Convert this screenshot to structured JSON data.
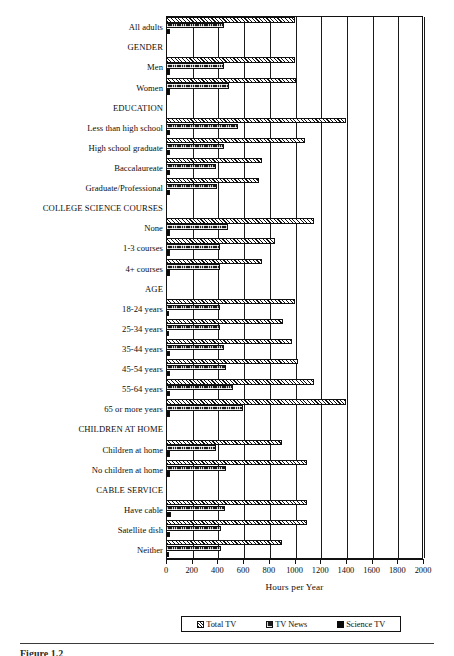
{
  "chart_data": {
    "type": "bar",
    "orientation": "horizontal",
    "title": "",
    "xlabel": "Hours per Year",
    "ylabel": "",
    "xlim": [
      0,
      2000
    ],
    "xticks": [
      0,
      200,
      400,
      600,
      800,
      1000,
      1200,
      1400,
      1600,
      1800,
      2000
    ],
    "grid": true,
    "legend_position": "bottom",
    "series": [
      {
        "name": "Total TV",
        "pattern": "diagonal-hatch"
      },
      {
        "name": "TV News",
        "pattern": "dark-checker"
      },
      {
        "name": "Science TV",
        "pattern": "solid-black"
      }
    ],
    "categories": [
      {
        "label": "All adults",
        "type": "item",
        "total_tv": 1000,
        "tv_news": 450,
        "science_tv": 30
      },
      {
        "label": "GENDER",
        "type": "header",
        "total_tv": null,
        "tv_news": null,
        "science_tv": null
      },
      {
        "label": "Men",
        "type": "item",
        "total_tv": 1000,
        "tv_news": 450,
        "science_tv": 30
      },
      {
        "label": "Women",
        "type": "item",
        "total_tv": 1010,
        "tv_news": 490,
        "science_tv": 30
      },
      {
        "label": "EDUCATION",
        "type": "header",
        "total_tv": null,
        "tv_news": null,
        "science_tv": null
      },
      {
        "label": "Less than high school",
        "type": "item",
        "total_tv": 1400,
        "tv_news": 560,
        "science_tv": 30
      },
      {
        "label": "High school graduate",
        "type": "item",
        "total_tv": 1080,
        "tv_news": 450,
        "science_tv": 30
      },
      {
        "label": "Baccalaureate",
        "type": "item",
        "total_tv": 750,
        "tv_news": 390,
        "science_tv": 35
      },
      {
        "label": "Graduate/Professional",
        "type": "item",
        "total_tv": 720,
        "tv_news": 400,
        "science_tv": 35
      },
      {
        "label": "COLLEGE SCIENCE COURSES",
        "type": "header",
        "total_tv": null,
        "tv_news": null,
        "science_tv": null
      },
      {
        "label": "None",
        "type": "item",
        "total_tv": 1150,
        "tv_news": 480,
        "science_tv": 30
      },
      {
        "label": "1-3 courses",
        "type": "item",
        "total_tv": 850,
        "tv_news": 420,
        "science_tv": 30
      },
      {
        "label": "4+ courses",
        "type": "item",
        "total_tv": 750,
        "tv_news": 420,
        "science_tv": 35
      },
      {
        "label": "AGE",
        "type": "header",
        "total_tv": null,
        "tv_news": null,
        "science_tv": null
      },
      {
        "label": "18-24 years",
        "type": "item",
        "total_tv": 1000,
        "tv_news": 420,
        "science_tv": 25
      },
      {
        "label": "25-34 years",
        "type": "item",
        "total_tv": 910,
        "tv_news": 420,
        "science_tv": 25
      },
      {
        "label": "35-44 years",
        "type": "item",
        "total_tv": 980,
        "tv_news": 450,
        "science_tv": 30
      },
      {
        "label": "45-54 years",
        "type": "item",
        "total_tv": 1030,
        "tv_news": 470,
        "science_tv": 30
      },
      {
        "label": "55-64 years",
        "type": "item",
        "total_tv": 1150,
        "tv_news": 520,
        "science_tv": 35
      },
      {
        "label": "65 or more years",
        "type": "item",
        "total_tv": 1400,
        "tv_news": 600,
        "science_tv": 35
      },
      {
        "label": "CHILDREN AT HOME",
        "type": "header",
        "total_tv": null,
        "tv_news": null,
        "science_tv": null
      },
      {
        "label": "Children at home",
        "type": "item",
        "total_tv": 900,
        "tv_news": 390,
        "science_tv": 35
      },
      {
        "label": "No children at home",
        "type": "item",
        "total_tv": 1100,
        "tv_news": 470,
        "science_tv": 35
      },
      {
        "label": "CABLE SERVICE",
        "type": "header",
        "total_tv": null,
        "tv_news": null,
        "science_tv": null
      },
      {
        "label": "Have cable",
        "type": "item",
        "total_tv": 1100,
        "tv_news": 460,
        "science_tv": 40
      },
      {
        "label": "Satellite dish",
        "type": "item",
        "total_tv": 1100,
        "tv_news": 430,
        "science_tv": 30
      },
      {
        "label": "Neither",
        "type": "item",
        "total_tv": 900,
        "tv_news": 430,
        "science_tv": 25
      }
    ]
  },
  "legend": {
    "items": [
      {
        "label": "Total TV",
        "pattern": "total"
      },
      {
        "label": "TV News",
        "pattern": "news"
      },
      {
        "label": "Science TV",
        "pattern": "science"
      }
    ]
  },
  "axis": {
    "title": "Hours per Year",
    "ticks": [
      "0",
      "200",
      "400",
      "600",
      "800",
      "1000",
      "1200",
      "1400",
      "1600",
      "1800",
      "2000"
    ]
  },
  "footer": {
    "caption": "Figure 1.2"
  }
}
